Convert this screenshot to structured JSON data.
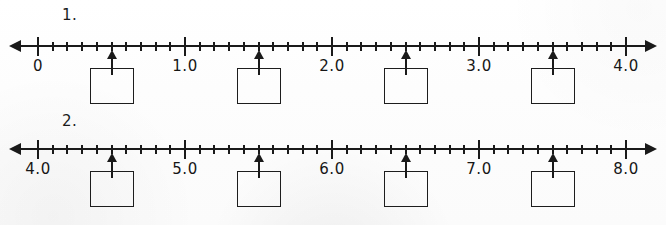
{
  "worksheet": {
    "background_color": "#ffffff",
    "ink_color": "#1a1a1a",
    "problems": [
      {
        "number_label": "1.",
        "line": {
          "start_value": 0,
          "end_value": 4.0,
          "minor_step": 0.1,
          "major_step": 1.0,
          "left_arrow": "left-arrowhead",
          "right_arrow": "right-arrowhead",
          "tick_labels": [
            "0",
            "1.0",
            "2.0",
            "3.0",
            "4.0"
          ],
          "tick_label_values": [
            0,
            1.0,
            2.0,
            3.0,
            4.0
          ]
        },
        "markers": [
          {
            "value": 0.5,
            "answer": ""
          },
          {
            "value": 1.5,
            "answer": ""
          },
          {
            "value": 2.5,
            "answer": ""
          },
          {
            "value": 3.5,
            "answer": ""
          }
        ]
      },
      {
        "number_label": "2.",
        "line": {
          "start_value": 4.0,
          "end_value": 8.0,
          "minor_step": 0.1,
          "major_step": 1.0,
          "left_arrow": "left-arrowhead",
          "right_arrow": "right-arrowhead",
          "tick_labels": [
            "4.0",
            "5.0",
            "6.0",
            "7.0",
            "8.0"
          ],
          "tick_label_values": [
            4.0,
            5.0,
            6.0,
            7.0,
            8.0
          ]
        },
        "markers": [
          {
            "value": 4.5,
            "answer": ""
          },
          {
            "value": 5.5,
            "answer": ""
          },
          {
            "value": 6.5,
            "answer": ""
          },
          {
            "value": 7.5,
            "answer": ""
          }
        ]
      }
    ]
  }
}
